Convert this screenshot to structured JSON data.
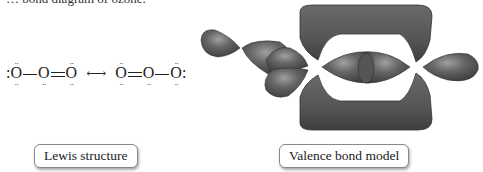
{
  "caption_partial": "… bond diagram of ozone.",
  "lewis_structure": {
    "resonance_form_1": [
      "O",
      "—",
      "O",
      "=",
      "O"
    ],
    "resonance_form_2": [
      "O",
      "=",
      "O",
      "—",
      "O"
    ],
    "resonance_arrow": "⟷",
    "lone_pair_glyph": "··",
    "side_pair_glyph": ":"
  },
  "labels": {
    "lewis": "Lewis structure",
    "valence_bond": "Valence bond model"
  },
  "colors": {
    "orbital_fill": "#5f5f5f",
    "orbital_highlight": "#9a9a9a",
    "orbital_shadow": "#3a3a3a",
    "label_border": "#888888"
  }
}
